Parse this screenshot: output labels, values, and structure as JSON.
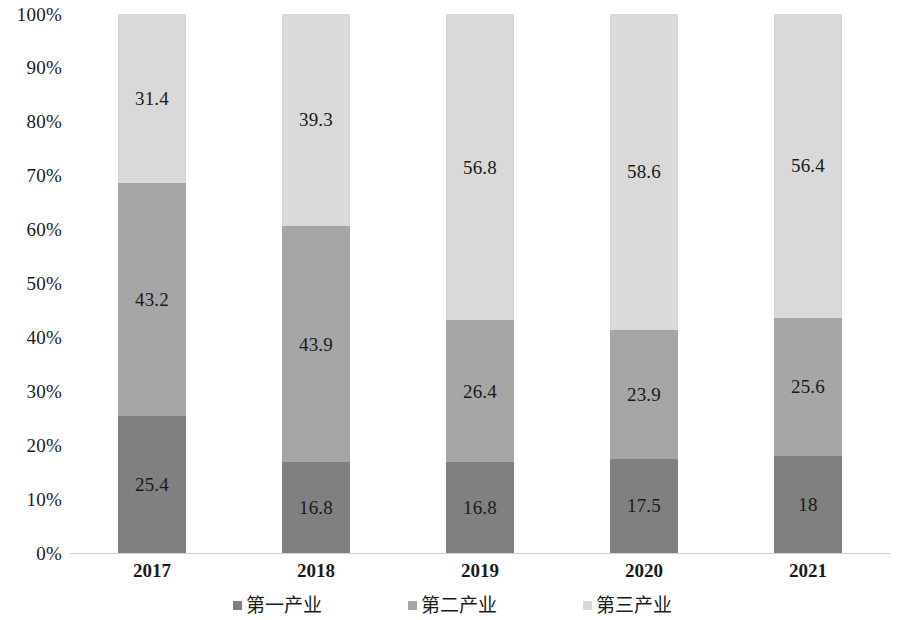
{
  "chart_data": {
    "type": "bar",
    "subtype": "100% stacked bar",
    "title": "",
    "subtitle": "",
    "xlabel": "",
    "ylabel": "",
    "categories": [
      "2017",
      "2018",
      "2019",
      "2020",
      "2021"
    ],
    "series": [
      {
        "name": "第一产业",
        "color": "#808080",
        "values": [
          25.4,
          16.8,
          16.8,
          17.5,
          18
        ],
        "labels": [
          "25.4",
          "16.8",
          "16.8",
          "17.5",
          "18"
        ]
      },
      {
        "name": "第二产业",
        "color": "#a6a6a6",
        "values": [
          43.2,
          43.9,
          26.4,
          23.9,
          25.6
        ],
        "labels": [
          "43.2",
          "43.9",
          "26.4",
          "23.9",
          "25.6"
        ]
      },
      {
        "name": "第三产业",
        "color": "#d9d9d9",
        "values": [
          31.4,
          39.3,
          56.8,
          58.6,
          56.4
        ],
        "labels": [
          "31.4",
          "39.3",
          "56.8",
          "58.6",
          "56.4"
        ]
      }
    ],
    "y_ticks": [
      "0%",
      "10%",
      "20%",
      "30%",
      "40%",
      "50%",
      "60%",
      "70%",
      "80%",
      "90%",
      "100%"
    ],
    "ylim": [
      0,
      100
    ],
    "grid": false,
    "legend_position": "bottom",
    "axis_line_color": "#d2d2d2",
    "label_color": "#1a1a1a"
  },
  "legend": {
    "items": [
      {
        "label": "第一产业",
        "color": "#808080"
      },
      {
        "label": "第二产业",
        "color": "#a6a6a6"
      },
      {
        "label": "第三产业",
        "color": "#d9d9d9"
      }
    ]
  }
}
